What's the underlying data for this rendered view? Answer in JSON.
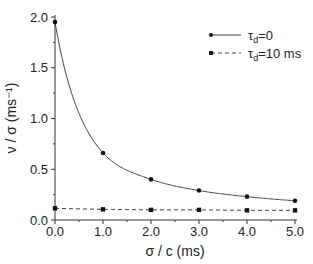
{
  "chart_data": {
    "type": "line",
    "title": "",
    "xlabel": "σ / c (ms)",
    "ylabel": "ν / σ (ms⁻¹)",
    "xlim": [
      0,
      5
    ],
    "ylim": [
      0,
      2
    ],
    "x_ticks": [
      "0.0",
      "1.0",
      "2.0",
      "3.0",
      "4.0",
      "5.0"
    ],
    "y_ticks": [
      "0.0",
      "0.5",
      "1.0",
      "1.5",
      "2.0"
    ],
    "grid": false,
    "legend_position": "upper right",
    "x": [
      0,
      1,
      2,
      3,
      4,
      5
    ],
    "series": [
      {
        "name": "τd=0",
        "style": "solid",
        "marker": "circle",
        "values": [
          1.95,
          0.66,
          0.4,
          0.29,
          0.23,
          0.19
        ]
      },
      {
        "name": "τd=10 ms",
        "style": "dashed",
        "marker": "square",
        "values": [
          0.115,
          0.105,
          0.1,
          0.1,
          0.095,
          0.095
        ]
      }
    ]
  },
  "legend": {
    "items": [
      {
        "sym": "τ",
        "sub": "d",
        "rest": "=0"
      },
      {
        "sym": "τ",
        "sub": "d",
        "rest": "=10 ms"
      }
    ]
  }
}
